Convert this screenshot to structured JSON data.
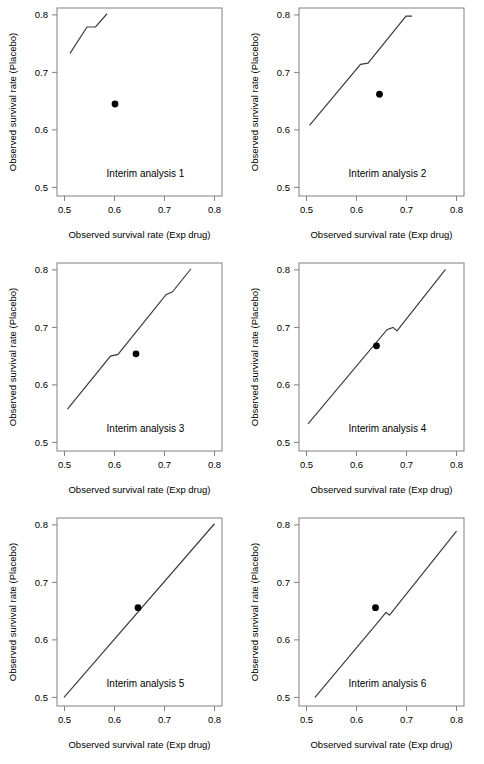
{
  "figure": {
    "layout": "2 columns x 3 rows",
    "background": "#ffffff",
    "line_color": "#3a3a3a",
    "point_color": "#000000",
    "frame_color": "#808080"
  },
  "axes": {
    "xlabel": "Observed survival rate (Exp drug)",
    "ylabel": "Observed survival rate (Placebo)",
    "xticks": [
      "0.5",
      "0.6",
      "0.7",
      "0.8"
    ],
    "yticks": [
      "0.5",
      "0.6",
      "0.7",
      "0.8"
    ],
    "xlim": [
      0.485,
      0.815
    ],
    "ylim": [
      0.485,
      0.812
    ]
  },
  "chart_data": [
    {
      "type": "line",
      "title": "Interim analysis 1",
      "xlabel": "Observed survival rate (Exp drug)",
      "ylabel": "Observed survival rate (Placebo)",
      "xlim": [
        0.485,
        0.815
      ],
      "ylim": [
        0.485,
        0.812
      ],
      "xticks": [
        0.5,
        0.6,
        0.7,
        0.8
      ],
      "yticks": [
        0.5,
        0.6,
        0.7,
        0.8
      ],
      "grid": false,
      "legend": "none",
      "series": [
        {
          "name": "Stopping boundary",
          "x": [
            0.511,
            0.545,
            0.562,
            0.585
          ],
          "values": [
            0.733,
            0.779,
            0.779,
            0.802
          ]
        }
      ],
      "points": [
        {
          "name": "Observed",
          "x": 0.601,
          "y": 0.645
        }
      ]
    },
    {
      "type": "line",
      "title": "Interim analysis 2",
      "xlabel": "Observed survival rate (Exp drug)",
      "ylabel": "Observed survival rate (Placebo)",
      "xlim": [
        0.485,
        0.815
      ],
      "ylim": [
        0.485,
        0.812
      ],
      "xticks": [
        0.5,
        0.6,
        0.7,
        0.8
      ],
      "yticks": [
        0.5,
        0.6,
        0.7,
        0.8
      ],
      "grid": false,
      "legend": "none",
      "series": [
        {
          "name": "Stopping boundary",
          "x": [
            0.506,
            0.608,
            0.623,
            0.699,
            0.711
          ],
          "values": [
            0.608,
            0.714,
            0.716,
            0.798,
            0.798
          ]
        }
      ],
      "points": [
        {
          "name": "Observed",
          "x": 0.646,
          "y": 0.662
        }
      ]
    },
    {
      "type": "line",
      "title": "Interim analysis 3",
      "xlabel": "Observed survival rate (Exp drug)",
      "ylabel": "Observed survival rate (Placebo)",
      "xlim": [
        0.485,
        0.815
      ],
      "ylim": [
        0.485,
        0.812
      ],
      "xticks": [
        0.5,
        0.6,
        0.7,
        0.8
      ],
      "yticks": [
        0.5,
        0.6,
        0.7,
        0.8
      ],
      "grid": false,
      "legend": "none",
      "series": [
        {
          "name": "Stopping boundary",
          "x": [
            0.506,
            0.592,
            0.607,
            0.703,
            0.716,
            0.753
          ],
          "values": [
            0.558,
            0.65,
            0.653,
            0.757,
            0.762,
            0.802
          ]
        }
      ],
      "points": [
        {
          "name": "Observed",
          "x": 0.643,
          "y": 0.654
        }
      ]
    },
    {
      "type": "line",
      "title": "Interim analysis 4",
      "xlabel": "Observed survival rate (Exp drug)",
      "ylabel": "Observed survival rate (Placebo)",
      "xlim": [
        0.485,
        0.815
      ],
      "ylim": [
        0.485,
        0.812
      ],
      "xticks": [
        0.5,
        0.6,
        0.7,
        0.8
      ],
      "yticks": [
        0.5,
        0.6,
        0.7,
        0.8
      ],
      "grid": false,
      "legend": "none",
      "series": [
        {
          "name": "Stopping boundary",
          "x": [
            0.503,
            0.661,
            0.673,
            0.681,
            0.778
          ],
          "values": [
            0.532,
            0.696,
            0.7,
            0.694,
            0.801
          ]
        }
      ],
      "points": [
        {
          "name": "Observed",
          "x": 0.64,
          "y": 0.668
        }
      ]
    },
    {
      "type": "line",
      "title": "Interim analysis 5",
      "xlabel": "Observed survival rate (Exp drug)",
      "ylabel": "Observed survival rate (Placebo)",
      "xlim": [
        0.485,
        0.815
      ],
      "ylim": [
        0.485,
        0.812
      ],
      "xticks": [
        0.5,
        0.6,
        0.7,
        0.8
      ],
      "yticks": [
        0.5,
        0.6,
        0.7,
        0.8
      ],
      "grid": false,
      "legend": "none",
      "series": [
        {
          "name": "Stopping boundary",
          "x": [
            0.499,
            0.8
          ],
          "values": [
            0.5,
            0.802
          ]
        }
      ],
      "points": [
        {
          "name": "Observed",
          "x": 0.647,
          "y": 0.656
        }
      ]
    },
    {
      "type": "line",
      "title": "Interim analysis 6",
      "xlabel": "Observed survival rate (Exp drug)",
      "ylabel": "Observed survival rate (Placebo)",
      "xlim": [
        0.485,
        0.815
      ],
      "ylim": [
        0.485,
        0.812
      ],
      "xticks": [
        0.5,
        0.6,
        0.7,
        0.8
      ],
      "yticks": [
        0.5,
        0.6,
        0.7,
        0.8
      ],
      "grid": false,
      "legend": "none",
      "series": [
        {
          "name": "Stopping boundary",
          "x": [
            0.517,
            0.648,
            0.659,
            0.666,
            0.8
          ],
          "values": [
            0.5,
            0.636,
            0.648,
            0.643,
            0.789
          ]
        }
      ],
      "points": [
        {
          "name": "Observed",
          "x": 0.638,
          "y": 0.656
        }
      ]
    }
  ]
}
